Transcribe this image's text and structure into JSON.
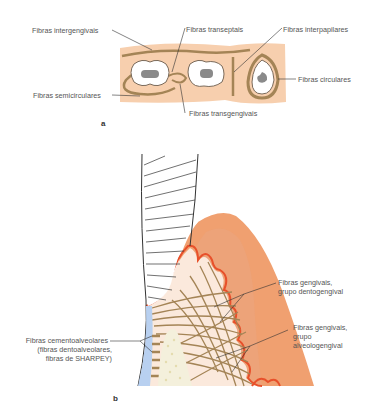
{
  "figure": {
    "panel_a": {
      "letter": "a",
      "labels": {
        "intergengivais": "Fibras intergengivais",
        "transeptais": "Fibras transeptais",
        "interpapilares": "Fibras interpapilares",
        "circulares": "Fibras circulares",
        "semicirculares": "Fibras semicirculares",
        "transgengivais": "Fibras transgengivais"
      }
    },
    "panel_b": {
      "letter": "b",
      "labels": {
        "dentogengival_1": "Fibras gengivais,",
        "dentogengival_2": "grupo dentogengival",
        "alveologengival_1": "Fibras gengivais,",
        "alveologengival_2": "grupo",
        "alveologengival_3": "alveologengival",
        "cemento_1": "Fibras cementoalveolares",
        "cemento_2": "(fibras dentoalveolares,",
        "cemento_3": "fibras de SHARPEY)"
      }
    },
    "colors": {
      "gingiva_light": "#f7cfae",
      "gingiva_dark": "#f0a070",
      "fiber": "#a48456",
      "epithelium_line": "#e8502a",
      "connective": "#fbe9dc",
      "tooth_pulp": "#8a8a8a",
      "cementum": "#b8d0f0",
      "bone": "#f4f0dc",
      "leader": "#333333"
    }
  }
}
